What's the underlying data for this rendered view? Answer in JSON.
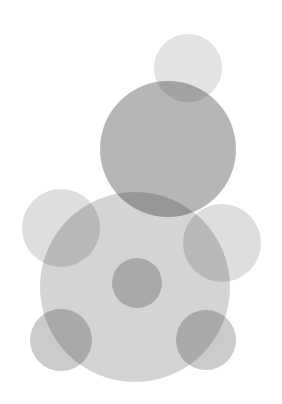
{
  "artwork": {
    "title": "Abstract Overlapping Circles",
    "description": "Composition of eight translucent gray circles forming a bear-like silhouette",
    "canvas": {
      "width": 282,
      "height": 404,
      "background_color": "#ffffff"
    },
    "palette": {
      "lightest_gray": "#e3e3e3",
      "light_gray": "#d8d8d8",
      "medium_gray": "#cfcfcf",
      "dark_gray": "#b4b4b4",
      "darkest_gray": "#a9a9a9",
      "background": "#ffffff"
    },
    "blend_mode": "multiply",
    "shapes": [
      {
        "name": "top-small-circle",
        "role": "head-top",
        "cx": 188,
        "cy": 68,
        "r": 34,
        "fill": "#bdbdbd",
        "opacity": 0.42
      },
      {
        "name": "head-circle",
        "role": "head",
        "cx": 168,
        "cy": 149,
        "r": 68,
        "fill": "#9a9a9a",
        "opacity": 0.72
      },
      {
        "name": "left-ear-circle",
        "role": "left-ear",
        "cx": 61,
        "cy": 228,
        "r": 39,
        "fill": "#bdbdbd",
        "opacity": 0.5
      },
      {
        "name": "right-ear-circle",
        "role": "right-ear",
        "cx": 222,
        "cy": 243,
        "r": 39,
        "fill": "#bdbdbd",
        "opacity": 0.5
      },
      {
        "name": "body-circle",
        "role": "body",
        "cx": 135,
        "cy": 287,
        "r": 95,
        "fill": "#b5b5b5",
        "opacity": 0.58
      },
      {
        "name": "center-dot-circle",
        "role": "snout",
        "cx": 137,
        "cy": 283,
        "r": 25,
        "fill": "#a0a0a0",
        "opacity": 0.55
      },
      {
        "name": "bottom-left-circle",
        "role": "left-paw",
        "cx": 61,
        "cy": 340,
        "r": 31,
        "fill": "#a0a0a0",
        "opacity": 0.55
      },
      {
        "name": "bottom-right-circle",
        "role": "right-paw",
        "cx": 206,
        "cy": 340,
        "r": 30,
        "fill": "#a0a0a0",
        "opacity": 0.55
      }
    ]
  }
}
